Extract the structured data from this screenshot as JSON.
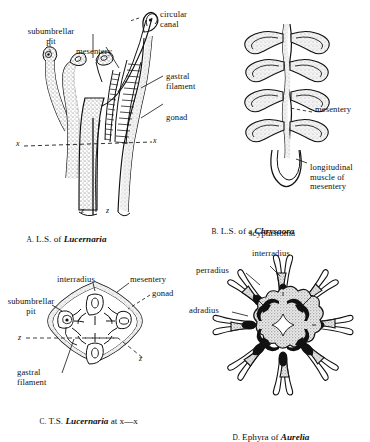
{
  "plate": {
    "title": "Scyphozoan anatomy plate",
    "background": "#ffffff",
    "ink": "#111111"
  },
  "panels": [
    {
      "id": "A",
      "caption_letter": "A.",
      "caption_text": " L.S. of ",
      "caption_taxon": "Lucernaria",
      "caption_suffix": "",
      "labels": [
        {
          "name": "subumbrellar-pit",
          "text": "subumbrellar\npit"
        },
        {
          "name": "mesentery",
          "text": "mesentery"
        },
        {
          "name": "circular-canal",
          "text": "circular\ncanal"
        },
        {
          "name": "gastral-filament",
          "text": "gastral\nfilament"
        },
        {
          "name": "gonad",
          "text": "gonad"
        }
      ],
      "section_marks": [
        {
          "name": "x-left",
          "text": "x"
        },
        {
          "name": "x-right",
          "text": "x"
        },
        {
          "name": "z-left",
          "text": "z"
        },
        {
          "name": "z-right",
          "text": "z"
        }
      ]
    },
    {
      "id": "B",
      "caption_letter": "B.",
      "caption_text": " L.S. of a ",
      "caption_taxon": "Chrysaora",
      "caption_suffix": "scyphistoma",
      "labels": [
        {
          "name": "mesentery",
          "text": "mesentery"
        },
        {
          "name": "longitudinal-muscle",
          "text": "longitudinal\nmuscle of\nmesentery"
        }
      ]
    },
    {
      "id": "C",
      "caption_letter": "C.",
      "caption_text": " T.S. ",
      "caption_taxon": "Lucernaria",
      "caption_suffix": " at x—x",
      "labels": [
        {
          "name": "interradius",
          "text": "interradius"
        },
        {
          "name": "mesentery",
          "text": "mesentery"
        },
        {
          "name": "gonad",
          "text": "gonad"
        },
        {
          "name": "subumbrellar-pit",
          "text": "subumbrellar\npit"
        },
        {
          "name": "gastral-filament",
          "text": "gastral\nfilament"
        }
      ],
      "section_marks": [
        {
          "name": "z-left",
          "text": "z"
        },
        {
          "name": "z-right",
          "text": "z"
        }
      ]
    },
    {
      "id": "D",
      "caption_letter": "D.",
      "caption_text": " Ephyra of ",
      "caption_taxon": "Aurelia",
      "caption_suffix": "",
      "labels": [
        {
          "name": "interradius",
          "text": "interradius"
        },
        {
          "name": "perradius",
          "text": "perradius"
        },
        {
          "name": "adradius",
          "text": "adradius"
        }
      ]
    }
  ]
}
